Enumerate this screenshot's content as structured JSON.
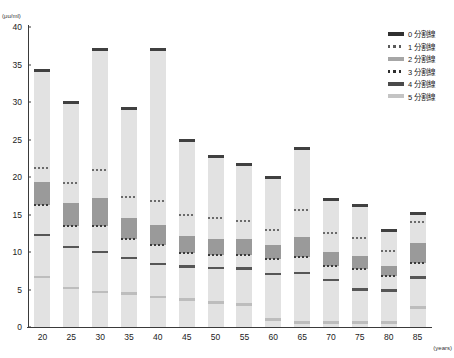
{
  "title": "",
  "chart_data": {
    "type": "bar",
    "title": "",
    "xlabel": "(years)",
    "ylabel": "(μu/ml)",
    "xlim": [
      17.5,
      87.5
    ],
    "ylim": [
      0,
      40
    ],
    "y_ticks": [
      0,
      5,
      10,
      15,
      20,
      25,
      30,
      35,
      40
    ],
    "x_ticks": [
      20,
      25,
      30,
      35,
      40,
      45,
      50,
      55,
      60,
      65,
      70,
      75,
      80,
      85
    ],
    "grid": false,
    "legend_position": "top-right",
    "categories": [
      "20",
      "25",
      "30",
      "35",
      "40",
      "45",
      "50",
      "55",
      "60",
      "65",
      "70",
      "75",
      "80",
      "85"
    ],
    "series": [
      {
        "name": "0 分割線",
        "key": "solid-dark",
        "values": [
          34.2,
          30.0,
          37.0,
          29.2,
          37.0,
          24.9,
          22.8,
          21.7,
          20.0,
          23.9,
          17.0,
          16.2,
          12.9,
          15.2
        ]
      },
      {
        "name": "1 分割線",
        "key": "dotted",
        "values": [
          21.2,
          19.2,
          21.0,
          17.4,
          16.8,
          15.0,
          14.6,
          14.2,
          13.0,
          15.6,
          12.6,
          11.9,
          10.1,
          14.0
        ]
      },
      {
        "name": "2 分割線",
        "key": "band",
        "values": [
          19.3,
          16.6,
          17.2,
          14.6,
          13.6,
          12.2,
          11.8,
          11.7,
          10.9,
          12.0,
          10.0,
          9.5,
          8.2,
          11.2
        ]
      },
      {
        "name": "3 分割線",
        "key": "dotted-dark",
        "values": [
          16.3,
          13.5,
          13.5,
          11.7,
          11.0,
          9.9,
          9.6,
          9.6,
          9.1,
          9.4,
          8.1,
          7.8,
          6.8,
          8.6
        ]
      },
      {
        "name": "4 分割線",
        "key": "solid-mid",
        "values": [
          12.3,
          10.7,
          10.0,
          9.2,
          8.4,
          8.1,
          7.9,
          7.8,
          7.1,
          7.2,
          6.3,
          5.0,
          4.9,
          6.6
        ]
      },
      {
        "name": "5 分割線",
        "key": "light",
        "values": [
          6.7,
          5.2,
          4.7,
          4.5,
          4.0,
          3.7,
          3.3,
          3.0,
          1.0,
          0.6,
          0.6,
          0.6,
          0.6,
          2.6
        ]
      }
    ]
  },
  "legend": {
    "items": [
      {
        "label": "0 分割線",
        "key": "solid-dark"
      },
      {
        "label": "1 分割線",
        "key": "dotted"
      },
      {
        "label": "2 分割線",
        "key": "band"
      },
      {
        "label": "3 分割線",
        "key": "dotted-dark"
      },
      {
        "label": "4 分割線",
        "key": "solid-mid"
      },
      {
        "label": "5 分割線",
        "key": "light"
      }
    ]
  },
  "colors": {
    "bar_fill": "#e2e2e2",
    "solid_dark": "#404040",
    "band": "#9a9a9a",
    "solid_mid": "#565656",
    "light": "#bdbdbd",
    "axis": "#3a3a3a"
  }
}
